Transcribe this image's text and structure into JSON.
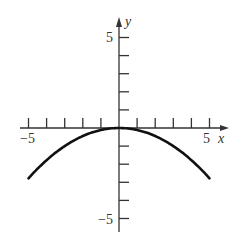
{
  "chart_data": {
    "type": "line",
    "title": "",
    "xlabel": "x",
    "ylabel": "y",
    "xlim": [
      -5,
      5
    ],
    "ylim": [
      -5,
      5
    ],
    "x_tick_labels": [
      "-5",
      "5"
    ],
    "y_tick_labels": [
      "5",
      "-5"
    ],
    "x_ticks": [
      -5,
      -4,
      -3,
      -2,
      -1,
      1,
      2,
      3,
      4,
      5
    ],
    "y_ticks": [
      -5,
      -4,
      -3,
      -2,
      -1,
      1,
      2,
      3,
      4,
      5
    ],
    "grid": false,
    "legend": null,
    "series": [
      {
        "name": "curve",
        "equation": "y = -x^2/9",
        "x": [
          -5,
          -4,
          -3,
          -2,
          -1,
          0,
          1,
          2,
          3,
          4,
          5
        ],
        "values": [
          -2.78,
          -1.78,
          -1.0,
          -0.44,
          -0.11,
          0,
          -0.11,
          -0.44,
          -1.0,
          -1.78,
          -2.78
        ]
      }
    ]
  },
  "labels": {
    "x_axis": "x",
    "y_axis": "y",
    "x_min": "−5",
    "x_max": "5",
    "y_max": "5",
    "y_min": "−5"
  },
  "colors": {
    "axis": "#333333",
    "curve": "#111111"
  }
}
